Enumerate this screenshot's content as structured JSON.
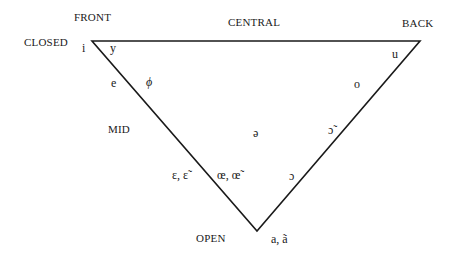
{
  "diagram": {
    "type": "vowel-triangle",
    "stroke_color": "#1a1a1a",
    "background": "#ffffff",
    "vertices": {
      "front_closed": [
        92,
        41
      ],
      "back_closed": [
        420,
        41
      ],
      "open": [
        257,
        231
      ]
    },
    "axis_labels": {
      "front": "FRONT",
      "central": "CENTRAL",
      "back": "BACK",
      "closed": "CLOSED",
      "mid": "MID",
      "open": "OPEN"
    },
    "vowels": {
      "i": "i",
      "y": "y",
      "u": "u",
      "e": "e",
      "phi": "ϕ",
      "o": "o",
      "schwa": "ə",
      "o_nasal": "ɔ̃",
      "epsilon": "ɛ, ɛ̃",
      "oe": "œ, œ̃",
      "open_o": "ɔ",
      "a": "a, ã"
    }
  }
}
